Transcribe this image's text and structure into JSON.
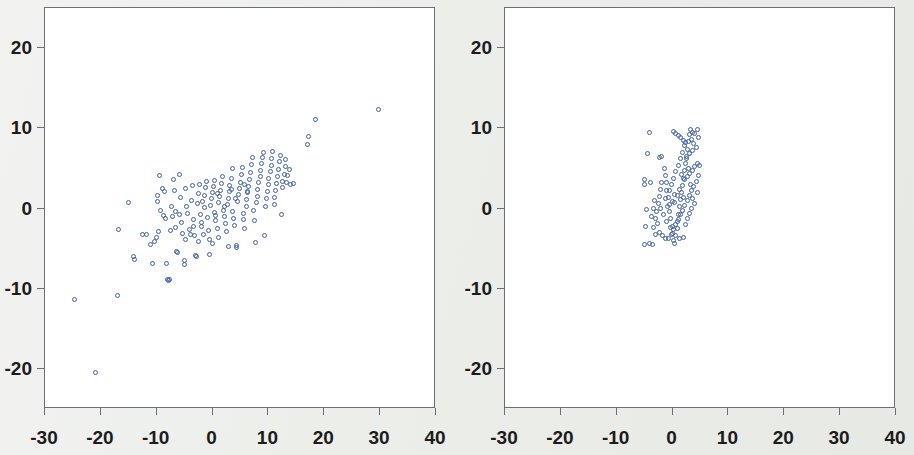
{
  "figure": {
    "background_color": "#eceeeb",
    "plot_background_color": "#ffffff",
    "frame_color": "#6d6f72",
    "marker_color": "#3f5fad",
    "tick_label_color": "#1c1c1c",
    "panel_count": 2
  },
  "chart_data": [
    {
      "type": "scatter",
      "title": "",
      "subtitle": "",
      "xlabel": "",
      "ylabel": "",
      "xlim": [
        -30,
        40
      ],
      "ylim": [
        -25,
        25
      ],
      "xticks": [
        -30,
        -20,
        -10,
        0,
        10,
        20,
        30,
        40
      ],
      "yticks": [
        20,
        10,
        0,
        -10,
        -20
      ],
      "xticklabels": [
        "-30",
        "-20",
        "-10",
        "0",
        "10",
        "20",
        "30",
        "40"
      ],
      "yticklabels": [
        "20",
        "10",
        "0",
        "-10",
        "-20"
      ],
      "grid": false,
      "legend": null,
      "marker": "open-circle",
      "marker_color": "#3f5fad",
      "annotations": [],
      "points": [
        [
          -24.8,
          -11.4
        ],
        [
          -21.0,
          -20.5
        ],
        [
          -17.0,
          -10.8
        ],
        [
          -16.8,
          -2.6
        ],
        [
          -15.0,
          0.7
        ],
        [
          -14.1,
          -6.0
        ],
        [
          -13.9,
          -6.3
        ],
        [
          -12.5,
          -3.2
        ],
        [
          -11.8,
          -3.3
        ],
        [
          -11.2,
          -4.5
        ],
        [
          -10.8,
          -6.8
        ],
        [
          -10.4,
          -4.1
        ],
        [
          -10.1,
          -3.6
        ],
        [
          -9.9,
          0.9
        ],
        [
          -9.8,
          1.6
        ],
        [
          -9.6,
          -2.9
        ],
        [
          -9.5,
          4.1
        ],
        [
          -9.3,
          -0.3
        ],
        [
          -9.0,
          2.5
        ],
        [
          -8.8,
          -0.9
        ],
        [
          -8.6,
          2.1
        ],
        [
          -8.4,
          -1.2
        ],
        [
          -8.2,
          -6.8
        ],
        [
          -8.0,
          -8.8
        ],
        [
          -7.9,
          -9.0
        ],
        [
          -7.7,
          -8.9
        ],
        [
          -7.6,
          -2.8
        ],
        [
          -7.4,
          0.3
        ],
        [
          -7.2,
          -1.0
        ],
        [
          -7.0,
          3.6
        ],
        [
          -6.9,
          2.3
        ],
        [
          -6.7,
          -0.4
        ],
        [
          -6.6,
          -2.4
        ],
        [
          -6.4,
          -5.3
        ],
        [
          -6.2,
          -5.5
        ],
        [
          -6.0,
          -0.8
        ],
        [
          -5.9,
          4.3
        ],
        [
          -5.7,
          1.4
        ],
        [
          -5.5,
          -1.7
        ],
        [
          -5.3,
          -3.1
        ],
        [
          -5.1,
          -6.5
        ],
        [
          -5.0,
          -7.0
        ],
        [
          -4.8,
          2.5
        ],
        [
          -4.6,
          0.2
        ],
        [
          -4.4,
          -0.6
        ],
        [
          -4.2,
          -2.6
        ],
        [
          -4.0,
          -3.3
        ],
        [
          -3.8,
          1.0
        ],
        [
          -3.6,
          2.9
        ],
        [
          -3.4,
          -1.4
        ],
        [
          -3.2,
          -3.4
        ],
        [
          -3.0,
          -5.8
        ],
        [
          -2.9,
          -6.0
        ],
        [
          -2.7,
          0.6
        ],
        [
          -2.5,
          1.9
        ],
        [
          -2.3,
          3.0
        ],
        [
          -2.1,
          -0.7
        ],
        [
          -1.9,
          -2.2
        ],
        [
          -1.7,
          -3.2
        ],
        [
          -1.5,
          0.1
        ],
        [
          -1.4,
          1.6
        ],
        [
          -1.2,
          2.6
        ],
        [
          -1.0,
          3.4
        ],
        [
          -0.9,
          -1.1
        ],
        [
          -0.8,
          -2.7
        ],
        [
          -0.6,
          -3.9
        ],
        [
          -0.5,
          -5.7
        ],
        [
          -0.3,
          0.4
        ],
        [
          -0.2,
          1.2
        ],
        [
          0.0,
          2.0
        ],
        [
          0.1,
          2.8
        ],
        [
          0.3,
          3.5
        ],
        [
          0.4,
          -0.5
        ],
        [
          0.6,
          -1.5
        ],
        [
          0.8,
          -2.5
        ],
        [
          1.0,
          -3.6
        ],
        [
          1.1,
          0.8
        ],
        [
          1.3,
          1.5
        ],
        [
          1.5,
          2.3
        ],
        [
          1.6,
          3.1
        ],
        [
          1.8,
          4.0
        ],
        [
          2.0,
          -0.2
        ],
        [
          2.1,
          -1.0
        ],
        [
          2.3,
          -1.9
        ],
        [
          2.5,
          -2.9
        ],
        [
          2.6,
          0.5
        ],
        [
          2.8,
          1.3
        ],
        [
          3.0,
          2.1
        ],
        [
          3.1,
          2.9
        ],
        [
          3.3,
          3.7
        ],
        [
          3.5,
          5.0
        ],
        [
          3.6,
          -0.4
        ],
        [
          3.8,
          -1.3
        ],
        [
          4.0,
          -2.1
        ],
        [
          4.2,
          -4.6
        ],
        [
          4.3,
          -4.9
        ],
        [
          4.5,
          0.9
        ],
        [
          4.6,
          1.7
        ],
        [
          4.8,
          2.5
        ],
        [
          5.0,
          3.3
        ],
        [
          5.1,
          4.2
        ],
        [
          5.3,
          5.1
        ],
        [
          5.5,
          -0.6
        ],
        [
          5.6,
          -1.4
        ],
        [
          5.8,
          -2.5
        ],
        [
          6.0,
          0.2
        ],
        [
          6.1,
          1.1
        ],
        [
          6.3,
          2.0
        ],
        [
          6.5,
          2.8
        ],
        [
          6.6,
          3.6
        ],
        [
          6.8,
          4.5
        ],
        [
          7.0,
          5.5
        ],
        [
          7.1,
          6.3
        ],
        [
          7.3,
          -0.3
        ],
        [
          7.5,
          -1.5
        ],
        [
          7.6,
          -4.2
        ],
        [
          7.8,
          0.7
        ],
        [
          8.0,
          1.5
        ],
        [
          8.1,
          2.4
        ],
        [
          8.3,
          3.2
        ],
        [
          8.5,
          4.0
        ],
        [
          8.6,
          4.8
        ],
        [
          8.8,
          5.6
        ],
        [
          9.0,
          6.3
        ],
        [
          9.1,
          7.0
        ],
        [
          9.3,
          -3.4
        ],
        [
          9.5,
          0.3
        ],
        [
          9.6,
          1.2
        ],
        [
          9.8,
          2.1
        ],
        [
          10.0,
          3.0
        ],
        [
          10.1,
          3.8
        ],
        [
          10.3,
          4.6
        ],
        [
          10.5,
          5.4
        ],
        [
          10.6,
          6.2
        ],
        [
          10.8,
          7.1
        ],
        [
          11.0,
          0.5
        ],
        [
          11.1,
          1.4
        ],
        [
          11.3,
          2.2
        ],
        [
          11.5,
          3.1
        ],
        [
          11.6,
          4.0
        ],
        [
          11.8,
          4.9
        ],
        [
          12.0,
          5.8
        ],
        [
          12.1,
          6.6
        ],
        [
          12.3,
          -0.8
        ],
        [
          12.5,
          2.6
        ],
        [
          12.6,
          3.4
        ],
        [
          12.8,
          4.3
        ],
        [
          13.0,
          5.2
        ],
        [
          13.1,
          6.1
        ],
        [
          13.3,
          3.2
        ],
        [
          13.5,
          4.1
        ],
        [
          13.8,
          4.9
        ],
        [
          14.0,
          3.0
        ],
        [
          14.5,
          3.1
        ],
        [
          17.0,
          8.0
        ],
        [
          17.2,
          9.0
        ],
        [
          18.5,
          11.1
        ],
        [
          29.7,
          12.3
        ],
        [
          -3.5,
          -2.3
        ],
        [
          -2.0,
          -1.8
        ],
        [
          0.5,
          -0.9
        ],
        [
          2.2,
          0.3
        ],
        [
          4.1,
          1.2
        ],
        [
          6.2,
          2.1
        ],
        [
          -1.8,
          0.9
        ],
        [
          0.9,
          1.9
        ],
        [
          3.4,
          2.4
        ],
        [
          5.7,
          3.0
        ],
        [
          -4.9,
          -3.9
        ],
        [
          -2.6,
          -4.1
        ],
        [
          -0.1,
          -4.4
        ],
        [
          2.9,
          -4.7
        ]
      ]
    },
    {
      "type": "scatter",
      "title": "",
      "subtitle": "",
      "xlabel": "",
      "ylabel": "",
      "xlim": [
        -30,
        40
      ],
      "ylim": [
        -25,
        25
      ],
      "xticks": [
        -30,
        -20,
        -10,
        0,
        10,
        20,
        30,
        40
      ],
      "yticks": [
        20,
        10,
        0,
        -10,
        -20
      ],
      "xticklabels": [
        "-30",
        "-20",
        "-10",
        "0",
        "10",
        "20",
        "30",
        "40"
      ],
      "yticklabels": [
        "20",
        "10",
        "0",
        "-10",
        "-20"
      ],
      "grid": false,
      "legend": null,
      "marker": "open-circle",
      "marker_color": "#3f5fad",
      "annotations": [],
      "points": [
        [
          -4.2,
          9.5
        ],
        [
          -4.5,
          6.9
        ],
        [
          -5.0,
          3.6
        ],
        [
          -5.0,
          3.0
        ],
        [
          -4.0,
          3.2
        ],
        [
          -4.6,
          -0.1
        ],
        [
          -4.9,
          -2.2
        ],
        [
          -5.0,
          -4.5
        ],
        [
          -4.2,
          -4.4
        ],
        [
          -3.6,
          -4.5
        ],
        [
          -3.0,
          -3.3
        ],
        [
          -3.4,
          -2.4
        ],
        [
          -3.1,
          -1.3
        ],
        [
          -2.9,
          -0.4
        ],
        [
          -2.6,
          0.6
        ],
        [
          -2.4,
          1.5
        ],
        [
          -2.2,
          2.4
        ],
        [
          -2.0,
          3.3
        ],
        [
          -2.4,
          6.4
        ],
        [
          -1.9,
          6.5
        ],
        [
          -1.5,
          5.0
        ],
        [
          -1.3,
          4.1
        ],
        [
          -1.1,
          3.2
        ],
        [
          -1.0,
          2.3
        ],
        [
          -0.8,
          1.4
        ],
        [
          -0.6,
          0.5
        ],
        [
          -0.5,
          -0.4
        ],
        [
          -0.3,
          -1.3
        ],
        [
          -0.1,
          -2.2
        ],
        [
          0.0,
          -3.1
        ],
        [
          0.2,
          -4.0
        ],
        [
          0.4,
          -4.4
        ],
        [
          0.6,
          -3.4
        ],
        [
          0.8,
          -2.5
        ],
        [
          0.9,
          -1.6
        ],
        [
          1.1,
          -0.7
        ],
        [
          1.3,
          0.2
        ],
        [
          1.5,
          1.1
        ],
        [
          1.6,
          2.0
        ],
        [
          1.8,
          2.9
        ],
        [
          2.0,
          3.8
        ],
        [
          2.1,
          4.7
        ],
        [
          2.3,
          5.6
        ],
        [
          2.5,
          6.5
        ],
        [
          2.6,
          7.4
        ],
        [
          2.8,
          8.3
        ],
        [
          3.0,
          9.2
        ],
        [
          0.1,
          9.6
        ],
        [
          0.5,
          9.4
        ],
        [
          1.0,
          9.1
        ],
        [
          1.4,
          8.8
        ],
        [
          1.9,
          8.5
        ],
        [
          2.4,
          8.2
        ],
        [
          3.2,
          9.8
        ],
        [
          3.6,
          9.5
        ],
        [
          4.0,
          9.3
        ],
        [
          3.4,
          8.6
        ],
        [
          3.8,
          8.1
        ],
        [
          4.2,
          7.6
        ],
        [
          3.5,
          7.2
        ],
        [
          3.0,
          6.8
        ],
        [
          2.5,
          6.2
        ],
        [
          4.4,
          5.6
        ],
        [
          4.0,
          5.2
        ],
        [
          3.5,
          4.8
        ],
        [
          3.0,
          4.4
        ],
        [
          2.6,
          4.0
        ],
        [
          2.2,
          3.6
        ],
        [
          4.6,
          4.1
        ],
        [
          4.2,
          3.4
        ],
        [
          3.8,
          2.8
        ],
        [
          3.4,
          2.2
        ],
        [
          3.0,
          1.6
        ],
        [
          2.6,
          1.0
        ],
        [
          2.2,
          0.4
        ],
        [
          1.8,
          -0.2
        ],
        [
          1.4,
          -0.8
        ],
        [
          1.0,
          -1.4
        ],
        [
          0.6,
          -2.0
        ],
        [
          0.2,
          -2.6
        ],
        [
          -0.2,
          -3.2
        ],
        [
          2.6,
          -1.2
        ],
        [
          3.0,
          -0.6
        ],
        [
          3.4,
          0.0
        ],
        [
          2.0,
          -3.6
        ],
        [
          1.2,
          -3.8
        ],
        [
          -1.3,
          -3.7
        ],
        [
          -1.8,
          -3.4
        ],
        [
          -2.4,
          -3.0
        ],
        [
          -2.2,
          0.0
        ],
        [
          -1.6,
          -0.8
        ],
        [
          -1.0,
          -1.6
        ],
        [
          -0.4,
          -2.4
        ],
        [
          0.4,
          0.8
        ],
        [
          0.8,
          1.6
        ],
        [
          1.2,
          2.4
        ],
        [
          -0.6,
          2.2
        ],
        [
          -0.2,
          3.0
        ],
        [
          0.2,
          3.8
        ],
        [
          0.6,
          4.6
        ],
        [
          1.0,
          5.4
        ],
        [
          1.4,
          6.2
        ],
        [
          1.8,
          7.0
        ],
        [
          2.2,
          7.8
        ],
        [
          -1.2,
          1.3
        ],
        [
          -0.9,
          0.3
        ],
        [
          -0.1,
          0.9
        ],
        [
          0.3,
          1.8
        ],
        [
          2.8,
          5.0
        ],
        [
          3.2,
          3.0
        ],
        [
          3.6,
          1.2
        ],
        [
          4.0,
          0.6
        ],
        [
          4.4,
          9.8
        ],
        [
          4.6,
          8.8
        ],
        [
          4.8,
          5.4
        ],
        [
          4.4,
          2.0
        ],
        [
          -3.3,
          1.0
        ],
        [
          -3.5,
          0.0
        ],
        [
          -3.8,
          -1.0
        ],
        [
          -2.7,
          -1.9
        ],
        [
          1.6,
          4.2
        ],
        [
          2.0,
          1.4
        ],
        [
          2.4,
          -2.0
        ],
        [
          -0.7,
          -3.8
        ]
      ]
    }
  ]
}
